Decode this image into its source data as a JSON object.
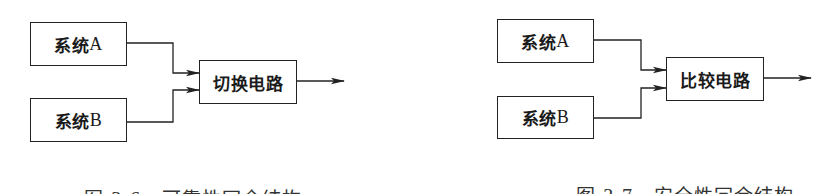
{
  "figures": [
    {
      "id": "fig-3-6",
      "inputs": [
        {
          "label_cn": "系统",
          "label_latin": "A"
        },
        {
          "label_cn": "系统",
          "label_latin": "B"
        }
      ],
      "processor": {
        "label": "切换电路"
      },
      "caption": {
        "prefix": "图 ",
        "number": "3-6",
        "title": "可靠性冗余结构"
      }
    },
    {
      "id": "fig-3-7",
      "inputs": [
        {
          "label_cn": "系统",
          "label_latin": "A"
        },
        {
          "label_cn": "系统",
          "label_latin": "B"
        }
      ],
      "processor": {
        "label": "比较电路"
      },
      "caption": {
        "prefix": "图 ",
        "number": "3-7",
        "title": "安全性冗余结构"
      }
    }
  ],
  "colors": {
    "stroke": "#222222",
    "text": "#1a1a1a",
    "caption": "#333333",
    "background": "#ffffff"
  }
}
